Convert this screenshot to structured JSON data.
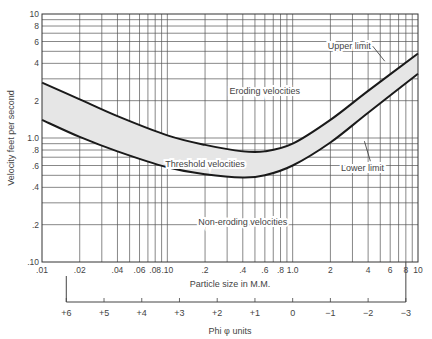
{
  "chart_data": {
    "type": "line",
    "title": "",
    "xlabel": "Particle size in M.M.",
    "ylabel": "Velocity feet per second",
    "xscale": "log",
    "yscale": "log",
    "xlim": [
      0.01,
      10
    ],
    "ylim": [
      0.1,
      10
    ],
    "grid": true,
    "x_tick_labels": [
      {
        "v": 0.01,
        "label": ".01"
      },
      {
        "v": 0.02,
        "label": ".02"
      },
      {
        "v": 0.04,
        "label": ".04"
      },
      {
        "v": 0.06,
        "label": ".06"
      },
      {
        "v": 0.08,
        "label": ".08"
      },
      {
        "v": 0.1,
        "label": ".10"
      },
      {
        "v": 0.2,
        "label": ".2"
      },
      {
        "v": 0.4,
        "label": ".4"
      },
      {
        "v": 0.6,
        "label": ".6"
      },
      {
        "v": 0.8,
        "label": ".8"
      },
      {
        "v": 1.0,
        "label": "1.0"
      },
      {
        "v": 2,
        "label": "2"
      },
      {
        "v": 4,
        "label": "4"
      },
      {
        "v": 6,
        "label": "6"
      },
      {
        "v": 8,
        "label": "8"
      },
      {
        "v": 10,
        "label": "10"
      }
    ],
    "y_tick_labels": [
      {
        "v": 10,
        "label": "10"
      },
      {
        "v": 8,
        "label": "8"
      },
      {
        "v": 6,
        "label": "6"
      },
      {
        "v": 4,
        "label": "4"
      },
      {
        "v": 2,
        "label": "2"
      },
      {
        "v": 1.0,
        "label": "1.0"
      },
      {
        "v": 0.8,
        "label": ".8"
      },
      {
        "v": 0.6,
        "label": ".6"
      },
      {
        "v": 0.4,
        "label": ".4"
      },
      {
        "v": 0.2,
        "label": ".2"
      },
      {
        "v": 0.1,
        "label": ".10"
      }
    ],
    "series": [
      {
        "name": "Upper limit",
        "x": [
          0.01,
          0.02,
          0.04,
          0.1,
          0.2,
          0.4,
          0.6,
          1.0,
          2,
          4,
          10
        ],
        "y": [
          2.8,
          2.05,
          1.5,
          1.05,
          0.88,
          0.78,
          0.78,
          0.9,
          1.4,
          2.4,
          4.8
        ]
      },
      {
        "name": "Lower limit",
        "x": [
          0.01,
          0.02,
          0.04,
          0.1,
          0.2,
          0.4,
          0.6,
          1.0,
          2,
          4,
          10
        ],
        "y": [
          1.4,
          1.02,
          0.78,
          0.58,
          0.51,
          0.48,
          0.5,
          0.6,
          0.92,
          1.6,
          3.3
        ]
      }
    ],
    "band_fill": "#e6e6e6",
    "region_labels": [
      {
        "text": "Eroding velocities",
        "x": 0.6,
        "y": 2.4
      },
      {
        "text": "Threshold velocities",
        "x": 0.2,
        "y": 0.62
      },
      {
        "text": "Non-eroding velocities",
        "x": 0.4,
        "y": 0.21
      }
    ],
    "annotations": [
      {
        "text": "Upper limit",
        "x": 4.2,
        "y": 5.2
      },
      {
        "text": "Lower limit",
        "x": 3.6,
        "y": 0.54
      }
    ],
    "secondary_x_axis": {
      "label": "Phi φ units",
      "ticks": [
        "+6",
        "+5",
        "+4",
        "+3",
        "+2",
        "+1",
        "0",
        "−1",
        "−2",
        "−3"
      ],
      "tick_values": [
        6,
        5,
        4,
        3,
        2,
        1,
        0,
        -1,
        -2,
        -3
      ]
    }
  }
}
